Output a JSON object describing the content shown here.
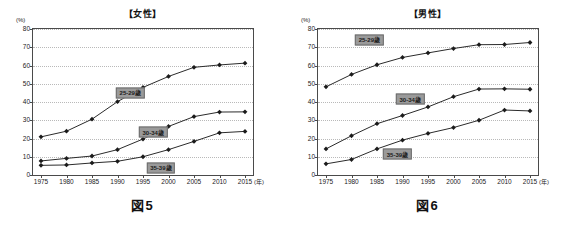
{
  "figures": [
    {
      "caption": "図5",
      "title": "【女性】",
      "y_unit": "(%)",
      "x_unit": "(年)",
      "label_positions": [
        {
          "series": 0,
          "x": 1992.5,
          "y": 45.0
        },
        {
          "series": 1,
          "x": 1997.0,
          "y": 23.5
        },
        {
          "series": 2,
          "x": 1998.5,
          "y": 4.0
        }
      ],
      "chart_data": {
        "type": "line",
        "title": "【女性】",
        "xlabel": "(年)",
        "ylabel": "(%)",
        "xlim": [
          1975,
          2015
        ],
        "ylim": [
          0,
          80
        ],
        "ytick_step": 10,
        "grid": true,
        "legend_position": "inline-labels",
        "categories": [
          1975,
          1980,
          1985,
          1990,
          1995,
          2000,
          2005,
          2010,
          2015
        ],
        "tick_labels": [
          "1975",
          "1980",
          "1985",
          "1990",
          "1995",
          "2000",
          "2005",
          "2010",
          "2015"
        ],
        "ytick_labels": [
          "0",
          "10",
          "20",
          "30",
          "40",
          "50",
          "60",
          "70",
          "80"
        ],
        "series": [
          {
            "name": "25-29歳",
            "values": [
              20.9,
              24.0,
              30.6,
              40.2,
              48.0,
              54.0,
              59.0,
              60.3,
              61.3
            ]
          },
          {
            "name": "30-34歳",
            "values": [
              7.7,
              9.1,
              10.4,
              13.9,
              19.7,
              26.6,
              32.0,
              34.5,
              34.6
            ]
          },
          {
            "name": "35-39歳",
            "values": [
              5.3,
              5.5,
              6.6,
              7.5,
              10.0,
              13.9,
              18.4,
              23.1,
              23.9
            ]
          }
        ]
      }
    },
    {
      "caption": "図6",
      "title": "【男性】",
      "y_unit": "(%)",
      "x_unit": "(年)",
      "label_positions": [
        {
          "series": 0,
          "x": 1983.5,
          "y": 74.0
        },
        {
          "series": 1,
          "x": 1991.5,
          "y": 41.5
        },
        {
          "series": 2,
          "x": 1989.0,
          "y": 11.5
        }
      ],
      "chart_data": {
        "type": "line",
        "title": "【男性】",
        "xlabel": "(年)",
        "ylabel": "(%)",
        "xlim": [
          1975,
          2015
        ],
        "ylim": [
          0,
          80
        ],
        "ytick_step": 10,
        "grid": true,
        "legend_position": "inline-labels",
        "categories": [
          1975,
          1980,
          1985,
          1990,
          1995,
          2000,
          2005,
          2010,
          2015
        ],
        "tick_labels": [
          "1975",
          "1980",
          "1985",
          "1990",
          "1995",
          "2000",
          "2005",
          "2010",
          "2015"
        ],
        "ytick_labels": [
          "0",
          "10",
          "20",
          "30",
          "40",
          "50",
          "60",
          "70",
          "80"
        ],
        "series": [
          {
            "name": "25-29歳",
            "values": [
              48.3,
              55.1,
              60.4,
              64.4,
              66.9,
              69.3,
              71.4,
              71.5,
              72.6
            ]
          },
          {
            "name": "30-34歳",
            "values": [
              14.3,
              21.5,
              28.1,
              32.6,
              37.3,
              42.9,
              47.1,
              47.2,
              47.0
            ]
          },
          {
            "name": "35-39歳",
            "values": [
              6.1,
              8.5,
              14.3,
              19.1,
              22.8,
              26.0,
              30.0,
              35.6,
              35.1
            ]
          }
        ]
      }
    }
  ]
}
